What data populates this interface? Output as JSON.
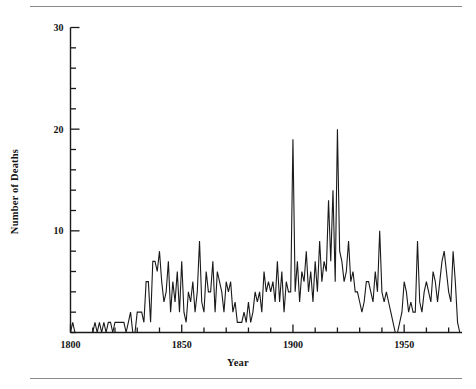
{
  "figure": {
    "rule_top": "horizontal-rule",
    "rule_bottom": "horizontal-rule",
    "line_color": "#1a1a1a",
    "axis_color": "#1a1a1a",
    "background": "#ffffff"
  },
  "chart_data": {
    "type": "line",
    "title": "",
    "xlabel": "Year",
    "ylabel": "Number of Deaths",
    "xlim": [
      1800,
      1976
    ],
    "ylim": [
      0,
      30
    ],
    "grid": false,
    "legend": null,
    "x_major_ticks": [
      1800,
      1850,
      1900,
      1950
    ],
    "x_major_tick_labels": [
      "1800",
      "1850",
      "1900",
      "1950"
    ],
    "x_minor_tick_step": 10,
    "y_major_ticks": [
      10,
      20,
      30
    ],
    "y_major_tick_labels": [
      "10",
      "20",
      "30"
    ],
    "y_minor_tick_step": 2,
    "x": [
      1800,
      1801,
      1802,
      1803,
      1804,
      1805,
      1806,
      1807,
      1808,
      1809,
      1810,
      1811,
      1812,
      1813,
      1814,
      1815,
      1816,
      1817,
      1818,
      1819,
      1820,
      1821,
      1822,
      1823,
      1824,
      1825,
      1826,
      1827,
      1828,
      1829,
      1830,
      1831,
      1832,
      1833,
      1834,
      1835,
      1836,
      1837,
      1838,
      1839,
      1840,
      1841,
      1842,
      1843,
      1844,
      1845,
      1846,
      1847,
      1848,
      1849,
      1850,
      1851,
      1852,
      1853,
      1854,
      1855,
      1856,
      1857,
      1858,
      1859,
      1860,
      1861,
      1862,
      1863,
      1864,
      1865,
      1866,
      1867,
      1868,
      1869,
      1870,
      1871,
      1872,
      1873,
      1874,
      1875,
      1876,
      1877,
      1878,
      1879,
      1880,
      1881,
      1882,
      1883,
      1884,
      1885,
      1886,
      1887,
      1888,
      1889,
      1890,
      1891,
      1892,
      1893,
      1894,
      1895,
      1896,
      1897,
      1898,
      1899,
      1900,
      1901,
      1902,
      1903,
      1904,
      1905,
      1906,
      1907,
      1908,
      1909,
      1910,
      1911,
      1912,
      1913,
      1914,
      1915,
      1916,
      1917,
      1918,
      1919,
      1920,
      1921,
      1922,
      1923,
      1924,
      1925,
      1926,
      1927,
      1928,
      1929,
      1930,
      1931,
      1932,
      1933,
      1934,
      1935,
      1936,
      1937,
      1938,
      1939,
      1940,
      1941,
      1942,
      1943,
      1944,
      1945,
      1946,
      1947,
      1948,
      1949,
      1950,
      1951,
      1952,
      1953,
      1954,
      1955,
      1956,
      1957,
      1958,
      1959,
      1960,
      1961,
      1962,
      1963,
      1964,
      1965,
      1966,
      1967,
      1968,
      1969,
      1970,
      1971,
      1972,
      1973,
      1974,
      1975
    ],
    "values": [
      0,
      1,
      0,
      0,
      0,
      0,
      0,
      0,
      0,
      0,
      0,
      1,
      0,
      1,
      0,
      1,
      0,
      1,
      1,
      0,
      1,
      1,
      1,
      1,
      1,
      0,
      1,
      2,
      0,
      0,
      2,
      2,
      2,
      1,
      5,
      5,
      1,
      7,
      7,
      6,
      8,
      5,
      3,
      4,
      7,
      2,
      5,
      3,
      6,
      2,
      7,
      2,
      1,
      4,
      3,
      5,
      2,
      4,
      9,
      3,
      2,
      6,
      4,
      4,
      7,
      2,
      6,
      5,
      4,
      2,
      5,
      4,
      5,
      2,
      3,
      1,
      1,
      1,
      2,
      1,
      3,
      1,
      2,
      4,
      3,
      4,
      2,
      6,
      4,
      5,
      4,
      5,
      3,
      7,
      3,
      6,
      2,
      5,
      4,
      4,
      19,
      4,
      7,
      3,
      6,
      5,
      8,
      4,
      6,
      3,
      7,
      4,
      9,
      5,
      7,
      6,
      13,
      7,
      14,
      5,
      20,
      8,
      7,
      5,
      6,
      9,
      5,
      6,
      4,
      4,
      3,
      2,
      3,
      5,
      5,
      4,
      3,
      6,
      4,
      10,
      4,
      3,
      4,
      3,
      2,
      1,
      0,
      0,
      1,
      2,
      5,
      4,
      2,
      3,
      2,
      2,
      9,
      3,
      2,
      4,
      5,
      4,
      3,
      6,
      5,
      3,
      5,
      7,
      8,
      6,
      4,
      3,
      8,
      5,
      1,
      0
    ]
  }
}
